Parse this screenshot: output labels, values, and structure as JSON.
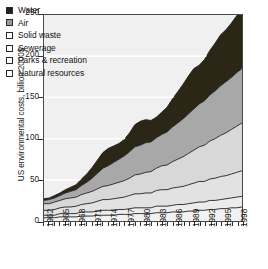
{
  "chart_data": {
    "type": "area",
    "stacked": true,
    "title": "",
    "xlabel": "",
    "ylabel": "US environmental costs, billion 2000$",
    "ylim": [
      0,
      250
    ],
    "xlim": [
      1962,
      1999
    ],
    "grid": "horizontal-white-gridlines",
    "legend_position": "top-left-inside",
    "ytick_labels": [
      "0",
      "50",
      "100",
      "150",
      "200",
      "250"
    ],
    "ytick_values": [
      0,
      50,
      100,
      150,
      200,
      250
    ],
    "xtick_labels": [
      "1962",
      "1965",
      "1968",
      "1971",
      "1974",
      "1977",
      "1980",
      "1983",
      "1986",
      "1989",
      "1992",
      "1995",
      "1998"
    ],
    "xtick_values": [
      1962,
      1965,
      1968,
      1971,
      1974,
      1977,
      1980,
      1983,
      1986,
      1989,
      1992,
      1995,
      1998
    ],
    "x": [
      1962,
      1963,
      1964,
      1965,
      1966,
      1967,
      1968,
      1969,
      1970,
      1971,
      1972,
      1973,
      1974,
      1975,
      1976,
      1977,
      1978,
      1979,
      1980,
      1981,
      1982,
      1983,
      1984,
      1985,
      1986,
      1987,
      1988,
      1989,
      1990,
      1991,
      1992,
      1993,
      1994,
      1995,
      1996,
      1997,
      1998,
      1999
    ],
    "series": [
      {
        "name": "Natural resources",
        "color": "#f2f2f2",
        "values": [
          4,
          4,
          4,
          5,
          5,
          5,
          5,
          6,
          6,
          6,
          7,
          7,
          7,
          7,
          8,
          8,
          8,
          9,
          9,
          9,
          9,
          10,
          10,
          10,
          11,
          11,
          11,
          12,
          12,
          13,
          13,
          14,
          14,
          15,
          15,
          16,
          16,
          17
        ]
      },
      {
        "name": "Parks & recreation",
        "color": "#ececec",
        "values": [
          3,
          3,
          3,
          4,
          4,
          4,
          4,
          5,
          5,
          5,
          5,
          6,
          6,
          6,
          6,
          6,
          7,
          7,
          7,
          7,
          7,
          8,
          8,
          8,
          8,
          9,
          9,
          9,
          10,
          10,
          10,
          11,
          11,
          11,
          12,
          12,
          13,
          13
        ]
      },
      {
        "name": "Sewerage",
        "color": "#e2e2e2",
        "values": [
          6,
          6,
          7,
          7,
          8,
          8,
          9,
          9,
          10,
          11,
          12,
          13,
          13,
          14,
          14,
          15,
          16,
          17,
          17,
          18,
          18,
          19,
          20,
          20,
          21,
          21,
          22,
          23,
          24,
          25,
          25,
          26,
          27,
          28,
          28,
          29,
          30,
          31
        ]
      },
      {
        "name": "Solid waste",
        "color": "#d8d8d8",
        "values": [
          8,
          8,
          9,
          9,
          10,
          11,
          11,
          12,
          13,
          14,
          15,
          16,
          17,
          18,
          19,
          20,
          21,
          23,
          24,
          25,
          26,
          27,
          29,
          30,
          32,
          34,
          36,
          38,
          40,
          42,
          44,
          46,
          48,
          50,
          52,
          54,
          56,
          58
        ]
      },
      {
        "name": "Air",
        "color": "#a8a8a8",
        "values": [
          4,
          5,
          5,
          6,
          7,
          8,
          9,
          11,
          13,
          16,
          19,
          22,
          24,
          26,
          28,
          30,
          32,
          34,
          35,
          36,
          36,
          37,
          38,
          40,
          42,
          44,
          46,
          48,
          50,
          52,
          54,
          56,
          58,
          60,
          62,
          63,
          65,
          66
        ]
      },
      {
        "name": "Water",
        "color": "#2b2616",
        "values": [
          2,
          2,
          3,
          3,
          4,
          5,
          6,
          8,
          10,
          13,
          16,
          19,
          21,
          20,
          19,
          20,
          23,
          27,
          29,
          28,
          26,
          25,
          27,
          30,
          34,
          38,
          42,
          46,
          49,
          47,
          50,
          54,
          58,
          62,
          63,
          66,
          69,
          71
        ]
      }
    ],
    "totals_note": "Stacked totals rise from about 27 in 1962 to about 256 in 1999"
  },
  "legend": {
    "items": [
      {
        "label": "Water",
        "swatch": "#241f10",
        "name": "water"
      },
      {
        "label": "Air",
        "swatch": "#9a9a9a",
        "name": "air"
      },
      {
        "label": "Solid waste",
        "swatch": "#ffffff",
        "name": "solid-waste"
      },
      {
        "label": "Sewerage",
        "swatch": "#ffffff",
        "name": "sewerage"
      },
      {
        "label": "Parks & recreation",
        "swatch": "#ffffff",
        "name": "parks-recreation"
      },
      {
        "label": "Natural resources",
        "swatch": "#ffffff",
        "name": "natural-resources"
      }
    ]
  },
  "axes": {
    "y_title": "US environmental costs, billion 2000$"
  }
}
